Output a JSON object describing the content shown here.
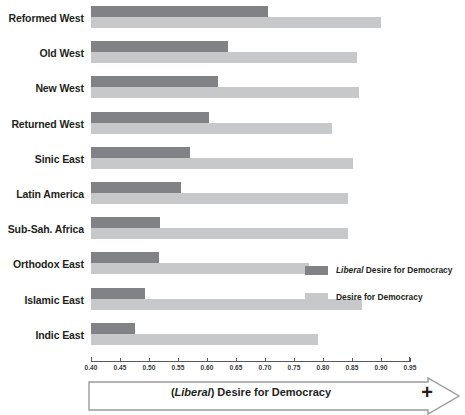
{
  "chart_data": {
    "type": "bar",
    "orientation": "horizontal",
    "title": "",
    "xlabel": "(Liberal) Desire for Democracy",
    "ylabel": "",
    "xlim": [
      0.4,
      0.95
    ],
    "xticks": [
      "0.40",
      "0.45",
      "0.50",
      "0.55",
      "0.60",
      "0.65",
      "0.70",
      "0.75",
      "0.80",
      "0.85",
      "0.90",
      "0.95"
    ],
    "grid": false,
    "legend_position": "middle-right",
    "categories": [
      "Reformed West",
      "Old West",
      "New West",
      "Returned West",
      "Sinic East",
      "Latin America",
      "Sub-Sah. Africa",
      "Orthodox East",
      "Islamic East",
      "Indic East"
    ],
    "series": [
      {
        "name": "Liberal Desire for Democracy",
        "color": "#808285",
        "values": [
          0.705,
          0.636,
          0.619,
          0.603,
          0.571,
          0.555,
          0.519,
          0.517,
          0.493,
          0.476
        ]
      },
      {
        "name": "Desire for Democracy",
        "color": "#c7c8ca",
        "values": [
          0.9,
          0.859,
          0.862,
          0.816,
          0.852,
          0.843,
          0.843,
          0.776,
          0.867,
          0.791
        ]
      }
    ]
  },
  "legend": {
    "items": [
      {
        "emphasis": "Liberal",
        "label": " Desire for Democracy",
        "swatch": "#808285"
      },
      {
        "emphasis": "",
        "label": "Desire for Democracy",
        "swatch": "#c7c8ca"
      }
    ]
  },
  "axis_title": {
    "prefix": "(",
    "emphasis": "Liberal",
    "suffix": ") Desire for Democracy",
    "plus": "+"
  },
  "colors": {
    "dark_bar": "#808285",
    "light_bar": "#c7c8ca",
    "axis": "#58595b",
    "text": "#231f20",
    "background": "#ffffff"
  }
}
